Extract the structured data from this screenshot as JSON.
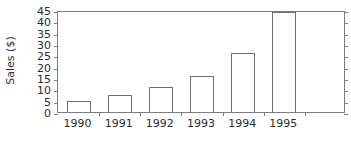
{
  "chart_data": {
    "type": "bar",
    "title": "",
    "xlabel": "",
    "ylabel": "Sales ($)",
    "categories": [
      "1990",
      "1991",
      "1992",
      "1993",
      "1994",
      "1995"
    ],
    "values": [
      5,
      7.5,
      11,
      16,
      26,
      44
    ],
    "ylim": [
      0,
      45
    ],
    "ytick_values": [
      0,
      5,
      10,
      15,
      20,
      25,
      30,
      35,
      40,
      45
    ],
    "ytick_labels": [
      "0",
      "5",
      "10",
      "15",
      "20",
      "25",
      "30",
      "35",
      "40",
      "45"
    ],
    "grid": false,
    "legend": null,
    "bar_style": {
      "fill": "#ffffff",
      "edge": "#6f6f6f"
    },
    "axis_color": "#7d7d7d",
    "text_color": "#2b2b2b",
    "background": "#ffffff",
    "n_slots": 7
  }
}
